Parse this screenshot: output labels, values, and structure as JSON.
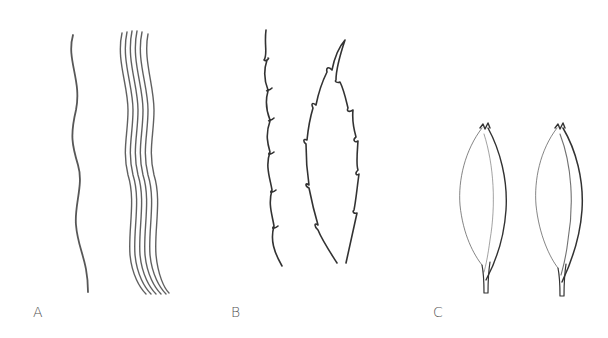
{
  "figure": {
    "background": "#ffffff",
    "stroke_color": "#3a3a3a",
    "panels": [
      {
        "id": "A",
        "label": "A",
        "description": "single wavy line and a bundle of parallel wavy lines"
      },
      {
        "id": "B",
        "label": "B",
        "description": "serrated margin and serrate leaf outline"
      },
      {
        "id": "C",
        "label": "C",
        "description": "two lanceolate bracts with notched tips"
      }
    ]
  }
}
